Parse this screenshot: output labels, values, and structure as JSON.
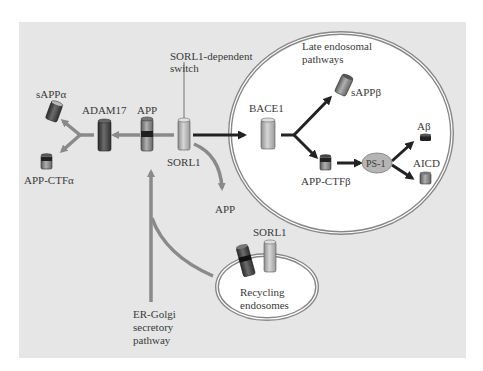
{
  "labels": {
    "sappa": "sAPPα",
    "adam17": "ADAM17",
    "app_top": "APP",
    "sorl1_switch_1": "SORL1-dependent",
    "sorl1_switch_2": "switch",
    "sorl1_mid": "SORL1",
    "app_ctfa": "APP-CTFα",
    "late_endo_1": "Late endosomal",
    "late_endo_2": "pathways",
    "sappb": "sAPPβ",
    "bace1": "BACE1",
    "abeta": "Aβ",
    "ps1": "PS-1",
    "aicd": "AICD",
    "app_ctfb": "APP-CTFβ",
    "app_released": "APP",
    "sorl1_recycling": "SORL1",
    "recycling_1": "Recycling",
    "recycling_2": "endosomes",
    "er_1": "ER-Golgi",
    "er_2": "secretory",
    "er_3": "pathway"
  },
  "colors": {
    "panel": "#e6e6e6",
    "arrow_gray": "#8a8a8a",
    "arrow_dark": "#222222",
    "membrane": "#888888",
    "compartment_fill": "#ffffff",
    "ps1_fill": "#b5b5b5"
  }
}
